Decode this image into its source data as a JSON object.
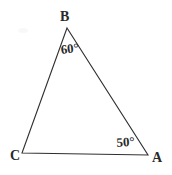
{
  "figure": {
    "kind": "geometry-diagram",
    "shape": "triangle",
    "background_color": "#ffffff",
    "stroke_color": "#2f2f2f",
    "text_color": "#2a2a2a",
    "stroke_width": 1.1,
    "width": 172,
    "height": 175,
    "vertices": [
      {
        "name": "B",
        "label": "B",
        "x": 67,
        "y": 28
      },
      {
        "name": "C",
        "label": "C",
        "x": 22,
        "y": 153
      },
      {
        "name": "A",
        "label": "A",
        "x": 148,
        "y": 155
      }
    ],
    "edges": [
      {
        "name": "edge-BC",
        "from": "B",
        "to": "C"
      },
      {
        "name": "edge-BA",
        "from": "B",
        "to": "A"
      },
      {
        "name": "edge-CA",
        "from": "C",
        "to": "A"
      }
    ],
    "angles": [
      {
        "at": "B",
        "label": "60°",
        "value": 60,
        "unit": "degrees"
      },
      {
        "at": "A",
        "label": "50°",
        "value": 50,
        "unit": "degrees"
      }
    ],
    "polygon_points": "67,28 22,153 148,155"
  }
}
